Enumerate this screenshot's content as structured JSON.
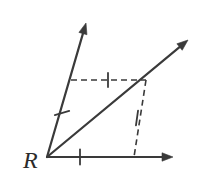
{
  "figure": {
    "kind": "geometry-angle-bisector-construction",
    "background_color": "#ffffff",
    "stroke_color": "#3a3a3a",
    "solid_stroke_width": 2.2,
    "dashed_stroke_width": 1.6,
    "tick_stroke_width": 1.8,
    "dash_pattern": "6 4",
    "vertex": {
      "label": "R",
      "x": 47,
      "y": 157,
      "label_x": 23,
      "label_y": 148
    },
    "rays": [
      {
        "name": "horizontal-ray",
        "from_x": 47,
        "from_y": 157,
        "to_x": 173,
        "to_y": 157,
        "arrowhead": true
      },
      {
        "name": "steep-ray",
        "from_x": 47,
        "from_y": 157,
        "to_x": 86,
        "to_y": 23,
        "arrowhead": true
      },
      {
        "name": "bisector-ray",
        "from_x": 47,
        "from_y": 157,
        "to_x": 188,
        "to_y": 40,
        "arrowhead": true
      }
    ],
    "dashed_segments": [
      {
        "name": "upper-dashed-segment",
        "from_x": 71,
        "from_y": 80,
        "to_x": 146,
        "to_y": 80
      },
      {
        "name": "lower-dashed-segment",
        "from_x": 146,
        "from_y": 80,
        "to_x": 134,
        "to_y": 157
      }
    ],
    "tick_marks": [
      {
        "name": "tick-horizontal-ray",
        "cx": 80,
        "cy": 157,
        "angle_deg": 90,
        "length": 15
      },
      {
        "name": "tick-steep-ray",
        "cx": 62,
        "cy": 113,
        "angle_deg": 16,
        "length": 15
      },
      {
        "name": "tick-upper-dashed",
        "cx": 108,
        "cy": 80,
        "angle_deg": 90,
        "length": 14
      },
      {
        "name": "tick-lower-dashed",
        "cx": 137,
        "cy": 118,
        "angle_deg": 82,
        "length": 15
      }
    ],
    "arrowhead": {
      "length": 11,
      "half_width": 4.2
    }
  }
}
